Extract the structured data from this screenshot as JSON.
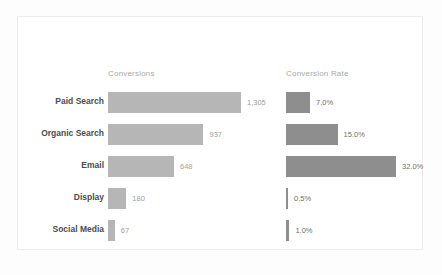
{
  "chart_data": {
    "type": "bar",
    "title": "",
    "subtitle": "",
    "xlabel": "",
    "ylabel": "",
    "orientation": "horizontal",
    "grid": false,
    "legend_position": "none",
    "categories": [
      "Paid Search",
      "Organic Search",
      "Email",
      "Display",
      "Social Media"
    ],
    "series": [
      {
        "name": "Conversions",
        "values": [
          1305,
          937,
          648,
          180,
          67
        ],
        "labels": [
          "1,305",
          "937",
          "648",
          "180",
          "67"
        ],
        "max": 1305,
        "color": "#b6b6b6"
      },
      {
        "name": "Conversion Rate",
        "values": [
          7.0,
          15.0,
          32.0,
          0.5,
          1.0
        ],
        "labels": [
          "7.0%",
          "15.0%",
          "32.0%",
          "0.5%",
          "1.0%"
        ],
        "max": 32.0,
        "color": "#8e8e8e"
      }
    ]
  },
  "card": {
    "background": "#ffffff",
    "border_color": "#ececec"
  },
  "page": {
    "background": "#fdfdfd"
  }
}
